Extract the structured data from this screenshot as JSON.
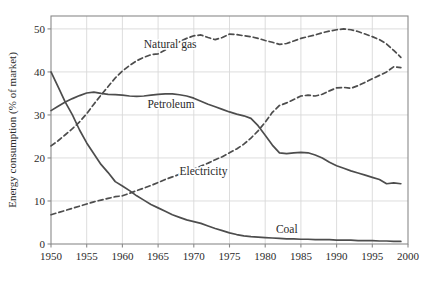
{
  "chart_data": {
    "type": "line",
    "title": "",
    "xlabel": "",
    "ylabel": "Energy consumption (% of market)",
    "xlim": [
      1950,
      2000
    ],
    "ylim": [
      0,
      53
    ],
    "xticks": [
      1950,
      1955,
      1960,
      1965,
      1970,
      1975,
      1980,
      1985,
      1990,
      1995,
      2000
    ],
    "xtick_labels": [
      "1950",
      "1955",
      "1960",
      "1965",
      "1970",
      "1975",
      "1980",
      "1985",
      "1990",
      "1995",
      "2000"
    ],
    "yticks": [
      0,
      10,
      20,
      30,
      40,
      50
    ],
    "ytick_labels": [
      "0",
      "10",
      "20",
      "30",
      "40",
      "50"
    ],
    "grid": true,
    "legend": "inline-annotations",
    "line_color": "#4d4d4d",
    "grid_color": "#d9d9d9",
    "frame_color": "#8a8a8a",
    "series": [
      {
        "name": "Natural gas",
        "style": "dashed",
        "label_x": 1963.0,
        "label_y": 46.4,
        "x": [
          1950,
          1951,
          1952,
          1953,
          1954,
          1955,
          1956,
          1957,
          1958,
          1959,
          1960,
          1961,
          1962,
          1963,
          1964,
          1965,
          1966,
          1967,
          1968,
          1969,
          1970,
          1971,
          1972,
          1973,
          1974,
          1975,
          1976,
          1977,
          1978,
          1979,
          1980,
          1981,
          1982,
          1983,
          1984,
          1985,
          1986,
          1987,
          1988,
          1989,
          1990,
          1991,
          1992,
          1993,
          1994,
          1995,
          1996,
          1997,
          1998,
          1999
        ],
        "y": [
          22.8,
          24.0,
          25.4,
          26.8,
          28.4,
          30.3,
          32.5,
          34.6,
          36.6,
          38.6,
          40.2,
          41.5,
          42.6,
          43.4,
          44.0,
          44.2,
          45.1,
          46.2,
          47.0,
          47.8,
          48.4,
          48.6,
          48.0,
          47.5,
          48.0,
          48.8,
          48.7,
          48.4,
          48.2,
          47.8,
          47.3,
          46.9,
          46.4,
          46.6,
          47.2,
          47.8,
          48.2,
          48.6,
          49.1,
          49.5,
          49.8,
          50.0,
          49.8,
          49.4,
          48.8,
          48.2,
          47.5,
          46.5,
          45.0,
          43.4
        ]
      },
      {
        "name": "Petroleum",
        "style": "solid",
        "label_x": 1963.5,
        "label_y": 32.5,
        "x": [
          1950,
          1951,
          1952,
          1953,
          1954,
          1955,
          1956,
          1957,
          1958,
          1959,
          1960,
          1961,
          1962,
          1963,
          1964,
          1965,
          1966,
          1967,
          1968,
          1969,
          1970,
          1971,
          1972,
          1973,
          1974,
          1975,
          1976,
          1977,
          1978,
          1979,
          1980,
          1981,
          1982,
          1983,
          1984,
          1985,
          1986,
          1987,
          1988,
          1989,
          1990,
          1991,
          1992,
          1993,
          1994,
          1995,
          1996,
          1997,
          1998,
          1999
        ],
        "y": [
          31.0,
          32.0,
          33.0,
          33.8,
          34.5,
          35.1,
          35.3,
          35.0,
          34.8,
          34.7,
          34.6,
          34.4,
          34.3,
          34.4,
          34.6,
          34.8,
          34.9,
          34.9,
          34.7,
          34.4,
          33.9,
          33.2,
          32.5,
          31.9,
          31.3,
          30.7,
          30.2,
          29.8,
          29.2,
          27.5,
          25.3,
          23.0,
          21.2,
          21.0,
          21.2,
          21.3,
          21.2,
          20.7,
          20.0,
          19.0,
          18.2,
          17.6,
          17.0,
          16.5,
          16.0,
          15.5,
          15.0,
          14.0,
          14.2,
          14.0
        ]
      },
      {
        "name": "Electricity",
        "style": "dashed",
        "label_x": 1968.0,
        "label_y": 17.0,
        "x": [
          1950,
          1951,
          1952,
          1953,
          1954,
          1955,
          1956,
          1957,
          1958,
          1959,
          1960,
          1961,
          1962,
          1963,
          1964,
          1965,
          1966,
          1967,
          1968,
          1969,
          1970,
          1971,
          1972,
          1973,
          1974,
          1975,
          1976,
          1977,
          1978,
          1979,
          1980,
          1981,
          1982,
          1983,
          1984,
          1985,
          1986,
          1987,
          1988,
          1989,
          1990,
          1991,
          1992,
          1993,
          1994,
          1995,
          1996,
          1997,
          1998,
          1999
        ],
        "y": [
          6.8,
          7.3,
          7.8,
          8.3,
          8.8,
          9.3,
          9.8,
          10.2,
          10.6,
          11.0,
          11.2,
          11.8,
          12.4,
          13.0,
          13.6,
          14.3,
          15.0,
          15.6,
          16.2,
          16.8,
          17.4,
          18.1,
          18.8,
          19.6,
          20.3,
          21.2,
          22.1,
          23.2,
          24.6,
          26.3,
          28.3,
          30.6,
          32.2,
          32.8,
          33.6,
          34.4,
          34.6,
          34.4,
          34.8,
          35.6,
          36.3,
          36.4,
          36.2,
          36.8,
          37.6,
          38.4,
          39.2,
          40.0,
          41.2,
          41.0
        ]
      },
      {
        "name": "Coal",
        "style": "solid",
        "label_x": 1981.5,
        "label_y": 3.6,
        "x": [
          1950,
          1951,
          1952,
          1953,
          1954,
          1955,
          1956,
          1957,
          1958,
          1959,
          1960,
          1961,
          1962,
          1963,
          1964,
          1965,
          1966,
          1967,
          1968,
          1969,
          1970,
          1971,
          1972,
          1973,
          1974,
          1975,
          1976,
          1977,
          1978,
          1979,
          1980,
          1981,
          1982,
          1983,
          1984,
          1985,
          1986,
          1987,
          1988,
          1989,
          1990,
          1991,
          1992,
          1993,
          1994,
          1995,
          1996,
          1997,
          1998,
          1999
        ],
        "y": [
          40.0,
          36.5,
          33.0,
          30.0,
          26.5,
          23.5,
          21.0,
          18.5,
          16.6,
          14.5,
          13.5,
          12.4,
          11.2,
          10.2,
          9.2,
          8.4,
          7.6,
          6.8,
          6.2,
          5.6,
          5.2,
          4.8,
          4.2,
          3.6,
          3.1,
          2.6,
          2.2,
          1.9,
          1.7,
          1.6,
          1.5,
          1.4,
          1.3,
          1.2,
          1.2,
          1.1,
          1.1,
          1.0,
          1.0,
          1.0,
          0.9,
          0.9,
          0.9,
          0.8,
          0.8,
          0.8,
          0.7,
          0.7,
          0.6,
          0.6
        ]
      }
    ]
  }
}
